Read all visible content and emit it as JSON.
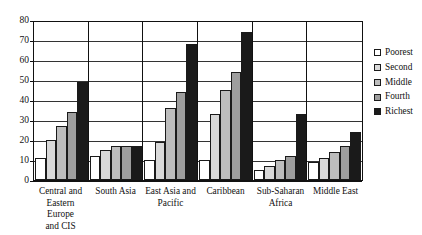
{
  "chart_data": {
    "type": "bar",
    "title": "",
    "xlabel": "",
    "ylabel": "",
    "ylim": [
      0,
      80
    ],
    "ytick_step": 10,
    "yticks": [
      0,
      10,
      20,
      30,
      40,
      50,
      60,
      70,
      80
    ],
    "grid": true,
    "legend_position": "right",
    "categories": [
      "Central and Eastern Europe and CIS",
      "South Asia",
      "East Asia and Pacific",
      "Caribbean",
      "Sub-Saharan Africa",
      "Middle East"
    ],
    "category_labels": [
      "Central and\nEastern Europe\nand CIS",
      "South Asia",
      "East Asia and\nPacific",
      "Caribbean",
      "Sub-Saharan\nAfrica",
      "Middle East"
    ],
    "series": [
      {
        "name": "Poorest",
        "color": "#ffffff",
        "values": [
          11,
          12,
          10,
          10,
          5,
          9
        ]
      },
      {
        "name": "Second",
        "color": "#d9d9d9",
        "values": [
          20,
          15,
          19,
          33,
          7,
          11
        ]
      },
      {
        "name": "Middle",
        "color": "#bdbdbd",
        "values": [
          27,
          17,
          36,
          45,
          10,
          14
        ]
      },
      {
        "name": "Fourth",
        "color": "#9e9e9e",
        "values": [
          34,
          17,
          44,
          54,
          12,
          17
        ]
      },
      {
        "name": "Richest",
        "color": "#1a1a1a",
        "values": [
          49,
          17,
          50,
          58,
          19,
          20
        ]
      }
    ],
    "richest_overlay": {
      "name": "Richest",
      "color": "#1a1a1a",
      "values": [
        49,
        17,
        68,
        74,
        33,
        24
      ]
    }
  },
  "legend": {
    "items": [
      {
        "label": "Poorest",
        "color": "#ffffff"
      },
      {
        "label": "Second",
        "color": "#d9d9d9"
      },
      {
        "label": "Middle",
        "color": "#bdbdbd"
      },
      {
        "label": "Fourth",
        "color": "#9e9e9e"
      },
      {
        "label": "Richest",
        "color": "#1a1a1a"
      }
    ]
  },
  "axis": {
    "y_tick_labels": [
      "80",
      "70",
      "60",
      "50",
      "40",
      "30",
      "20",
      "10",
      "0"
    ]
  }
}
